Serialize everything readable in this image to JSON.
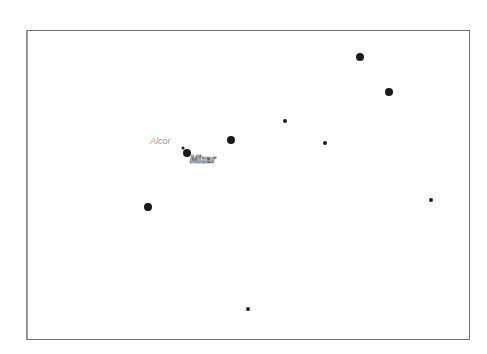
{
  "chart": {
    "frame": {
      "left": 26,
      "top": 30,
      "right": 470,
      "bottom": 340
    },
    "stars": [
      {
        "id": "star-1",
        "x": 360,
        "y": 57,
        "r": 4
      },
      {
        "id": "star-2",
        "x": 389,
        "y": 92,
        "r": 4
      },
      {
        "id": "star-3",
        "x": 285,
        "y": 121,
        "r": 2
      },
      {
        "id": "star-4",
        "x": 325,
        "y": 143,
        "r": 2
      },
      {
        "id": "star-5",
        "x": 231,
        "y": 140,
        "r": 4
      },
      {
        "id": "mizar",
        "x": 187,
        "y": 153,
        "r": 4
      },
      {
        "id": "alcor",
        "x": 183,
        "y": 148,
        "r": 1.5
      },
      {
        "id": "star-6",
        "x": 148,
        "y": 207,
        "r": 4
      },
      {
        "id": "star-7",
        "x": 431,
        "y": 200,
        "r": 2
      },
      {
        "id": "star-8",
        "x": 248,
        "y": 309,
        "r": 2
      }
    ],
    "labels": {
      "alcor": {
        "text": "Alcor",
        "x": 150,
        "y": 137
      },
      "mizar": {
        "text": "Mizar",
        "x": 190,
        "y": 155
      }
    },
    "colors": {
      "star": "#1a1a1a",
      "frame": "#6e6e6e",
      "alcor_label": "#9a9a9a",
      "mizar_label_outline": "#555555"
    }
  }
}
